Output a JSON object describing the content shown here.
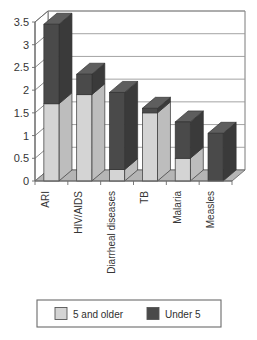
{
  "chart_data": {
    "type": "bar",
    "subtype": "stacked-column-3d",
    "title": "",
    "subtitle": "",
    "xlabel": "",
    "ylabel": "",
    "ylim": [
      0,
      3.5
    ],
    "yticks": [
      "0",
      "0.5",
      "1",
      "1.5",
      "2",
      "2.5",
      "3",
      "3.5"
    ],
    "ytick_values": [
      0,
      0.5,
      1,
      1.5,
      2,
      2.5,
      3,
      3.5
    ],
    "grid": true,
    "grid_axis": "y",
    "legend_position": "bottom",
    "categories": [
      "ARI",
      "HIV/AIDS",
      "Diarrheal diseases",
      "TB",
      "Malaria",
      "Measles"
    ],
    "category_label_rotation": -90,
    "series": [
      {
        "name": "5 and older",
        "color": "#d4d4d4",
        "values": [
          1.7,
          1.9,
          0.25,
          1.5,
          0.5,
          0.0
        ]
      },
      {
        "name": "Under 5",
        "color": "#4a4a4a",
        "values": [
          1.75,
          0.45,
          1.7,
          0.1,
          0.8,
          1.05
        ]
      }
    ],
    "totals": [
      3.45,
      2.35,
      1.95,
      1.6,
      1.3,
      1.05
    ]
  },
  "legend": {
    "items": [
      {
        "label": "5 and older",
        "color": "#d4d4d4"
      },
      {
        "label": "Under 5",
        "color": "#4a4a4a"
      }
    ]
  },
  "colors": {
    "series_light": "#d4d4d4",
    "series_light_side": "#bdbdbd",
    "series_light_top": "#e8e8e8",
    "series_dark": "#4a4a4a",
    "series_dark_side": "#3a3a3a",
    "series_dark_top": "#5e5e5e",
    "floor": "#b5b5b5",
    "wall": "#ffffff",
    "gridline": "#9a9a9a",
    "axis": "#6b6b6b",
    "text": "#353535",
    "legend_border": "#6b6b6b"
  }
}
